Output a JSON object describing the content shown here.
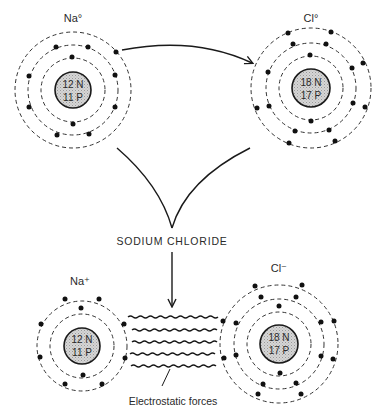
{
  "title": "SODIUM CHLORIDE",
  "colors": {
    "ink": "#1a1a1a",
    "nucleus_fill": "#cfcfcf",
    "background": "#ffffff"
  },
  "atoms": {
    "na_neutral": {
      "label": "Na°",
      "neutrons": "12 N",
      "protons": "11 P",
      "shell_electrons": [
        2,
        8,
        1
      ]
    },
    "cl_neutral": {
      "label": "Cl°",
      "neutrons": "18 N",
      "protons": "17 P",
      "shell_electrons": [
        2,
        8,
        7
      ]
    },
    "na_ion": {
      "label": "Na⁺",
      "neutrons": "12 N",
      "protons": "11 P",
      "shell_electrons": [
        2,
        8
      ]
    },
    "cl_ion": {
      "label": "Cl⁻",
      "neutrons": "18 N",
      "protons": "17 P",
      "shell_electrons": [
        2,
        8,
        8
      ]
    }
  },
  "bond": {
    "label": "Electrostatic forces",
    "line_count": 5
  },
  "arrows": [
    {
      "from": "Na° valence electron",
      "to": "Cl°"
    },
    {
      "from": "SODIUM CHLORIDE",
      "to": "ionic bond"
    }
  ]
}
